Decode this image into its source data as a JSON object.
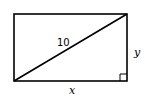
{
  "diagram": {
    "labels": {
      "diagonal": "10",
      "height": "y",
      "width": "x"
    },
    "shapes": {
      "rectangle": {
        "x": 14,
        "y": 14,
        "width": 113,
        "height": 67
      },
      "diagonal": {
        "from": "bottom-left",
        "to": "top-right"
      },
      "right_angle_marker": "bottom-right"
    },
    "stroke_color": "#000000"
  }
}
